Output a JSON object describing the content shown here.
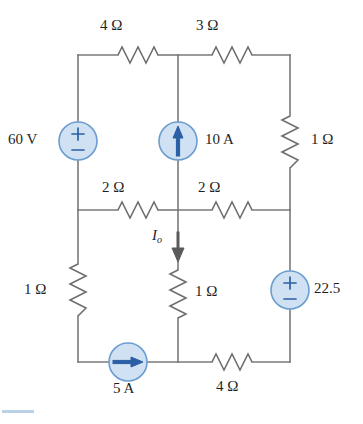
{
  "figure": {
    "kind": "circuit-schematic",
    "title": "",
    "colors": {
      "wire": "#7a7a7a",
      "source_fill": "#cfe1f2",
      "source_stroke": "#6b9dd0",
      "source_symbol": "#2a5fa5",
      "resistor": "#6e6e6e",
      "text": "#1f1f1f",
      "artifact": "#aec9e4"
    }
  },
  "labels": {
    "r_top_left": "4 Ω",
    "r_top_right": "3 Ω",
    "src_left": "60 V",
    "src_middle": "10 A",
    "r_right_upper": "1 Ω",
    "r_mid_left": "2 Ω",
    "r_mid_right": "2 Ω",
    "current_io": "I",
    "current_io_sub": "o",
    "r_middle_lower": "1 Ω",
    "r_left_lower": "1 Ω",
    "src_right": "22.5",
    "src_bottom": "5 A",
    "r_bottom_right": "4 Ω"
  },
  "components": [
    {
      "id": "r-top-left",
      "type": "resistor",
      "value": "4 Ω",
      "orientation": "horizontal",
      "branch": "top-left"
    },
    {
      "id": "r-top-right",
      "type": "resistor",
      "value": "3 Ω",
      "orientation": "horizontal",
      "branch": "top-right"
    },
    {
      "id": "src-left",
      "type": "voltage-source",
      "value": "60 V",
      "orientation": "vertical",
      "polarity": "plus-top",
      "branch": "left-upper"
    },
    {
      "id": "src-middle",
      "type": "current-source",
      "value": "10 A",
      "orientation": "vertical",
      "direction": "up",
      "branch": "middle-upper"
    },
    {
      "id": "r-right-upper",
      "type": "resistor",
      "value": "1 Ω",
      "orientation": "vertical",
      "branch": "right-upper"
    },
    {
      "id": "r-mid-left",
      "type": "resistor",
      "value": "2 Ω",
      "orientation": "horizontal",
      "branch": "middle-row-left"
    },
    {
      "id": "r-mid-right",
      "type": "resistor",
      "value": "2 Ω",
      "orientation": "horizontal",
      "branch": "middle-row-right"
    },
    {
      "id": "r-middle-lower",
      "type": "resistor",
      "value": "1 Ω",
      "orientation": "vertical",
      "branch": "middle-lower"
    },
    {
      "id": "r-left-lower",
      "type": "resistor",
      "value": "1 Ω",
      "orientation": "vertical",
      "branch": "left-lower"
    },
    {
      "id": "src-right",
      "type": "voltage-source",
      "value": "22.5",
      "orientation": "vertical",
      "polarity": "plus-top",
      "branch": "right-lower"
    },
    {
      "id": "src-bottom",
      "type": "current-source",
      "value": "5 A",
      "orientation": "horizontal",
      "direction": "right",
      "branch": "bottom-left"
    },
    {
      "id": "r-bottom-right",
      "type": "resistor",
      "value": "4 Ω",
      "orientation": "horizontal",
      "branch": "bottom-right"
    }
  ],
  "annotations": [
    {
      "id": "io-arrow",
      "label": "I_o",
      "direction": "down",
      "branch": "middle-lower"
    }
  ]
}
